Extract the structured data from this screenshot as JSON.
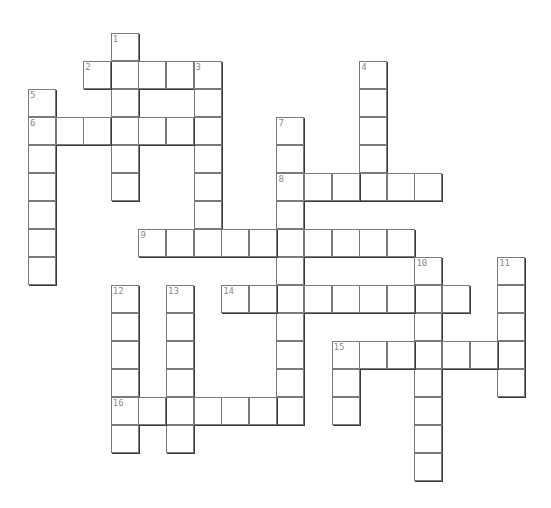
{
  "puzzle": {
    "type": "crossword",
    "grid_origin": {
      "x": 28,
      "y": 33
    },
    "cell_step": {
      "x": 27.6,
      "y": 28
    },
    "colors": {
      "border": "#7a7a7a",
      "shadow": "#3a3a3a",
      "number": "#8a8a8a",
      "background": "#ffffff"
    },
    "entries": [
      {
        "number": "1",
        "direction": "down",
        "col": 3,
        "row": 0,
        "length": 6
      },
      {
        "number": "2",
        "direction": "across",
        "col": 2,
        "row": 1,
        "length": 5
      },
      {
        "number": "3",
        "direction": "down",
        "col": 6,
        "row": 1,
        "length": 6
      },
      {
        "number": "4",
        "direction": "down",
        "col": 12,
        "row": 1,
        "length": 5
      },
      {
        "number": "5",
        "direction": "down",
        "col": 0,
        "row": 2,
        "length": 7
      },
      {
        "number": "6",
        "direction": "across",
        "col": 0,
        "row": 3,
        "length": 7
      },
      {
        "number": "7",
        "direction": "down",
        "col": 9,
        "row": 3,
        "length": 11
      },
      {
        "number": "8",
        "direction": "across",
        "col": 9,
        "row": 5,
        "length": 6
      },
      {
        "number": "9",
        "direction": "across",
        "col": 4,
        "row": 7,
        "length": 10
      },
      {
        "number": "10",
        "direction": "down",
        "col": 14,
        "row": 8,
        "length": 8
      },
      {
        "number": "11",
        "direction": "down",
        "col": 17,
        "row": 8,
        "length": 5
      },
      {
        "number": "12",
        "direction": "down",
        "col": 3,
        "row": 9,
        "length": 6
      },
      {
        "number": "13",
        "direction": "down",
        "col": 5,
        "row": 9,
        "length": 6
      },
      {
        "number": "14",
        "direction": "across",
        "col": 7,
        "row": 9,
        "length": 9
      },
      {
        "number": "15",
        "direction": "across",
        "col": 11,
        "row": 11,
        "length": 7
      },
      {
        "number": "15",
        "direction": "down",
        "col": 11,
        "row": 11,
        "length": 3
      },
      {
        "number": "16",
        "direction": "across",
        "col": 3,
        "row": 13,
        "length": 7
      }
    ]
  }
}
